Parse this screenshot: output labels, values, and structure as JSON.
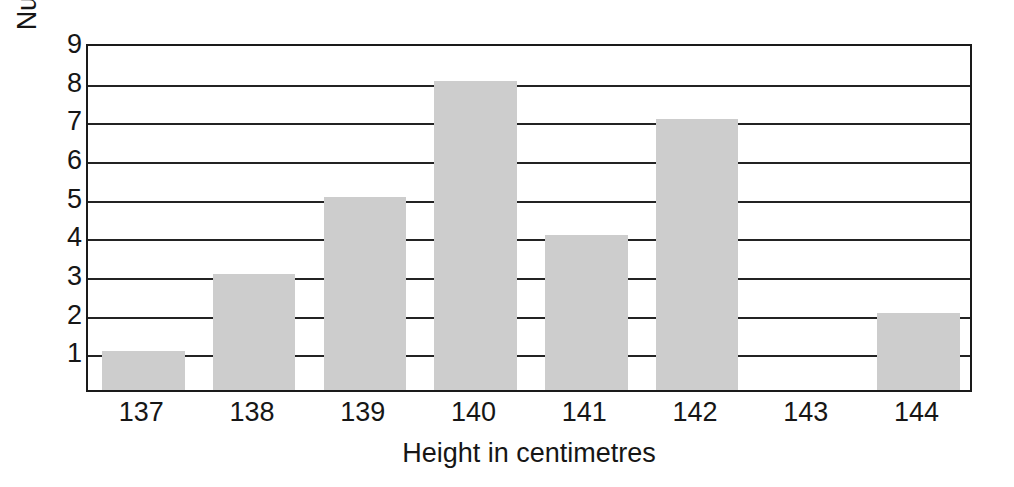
{
  "chart_data": {
    "type": "bar",
    "title": "",
    "subtitle": "",
    "xlabel": "Height in centimetres",
    "ylabel": "Number of children",
    "categories": [
      "137",
      "138",
      "139",
      "140",
      "141",
      "142",
      "143",
      "144"
    ],
    "values": [
      1,
      3,
      5,
      8,
      4,
      7,
      0,
      2
    ],
    "series": [
      {
        "name": "Number of children",
        "values": [
          1,
          3,
          5,
          8,
          4,
          7,
          0,
          2
        ]
      }
    ],
    "ylim": [
      0,
      9
    ],
    "yticks": [
      1,
      2,
      3,
      4,
      5,
      6,
      7,
      8,
      9
    ],
    "ytick_labels": [
      "1",
      "2",
      "3",
      "4",
      "5",
      "6",
      "7",
      "8",
      "9"
    ],
    "xtick_labels": [
      "137",
      "138",
      "139",
      "140",
      "141",
      "142",
      "143",
      "144"
    ],
    "grid": "horizontal",
    "legend": "none",
    "legend_position": "none",
    "bar_color": "#cdcdcd",
    "axis_color": "#1a1a1a",
    "grid_color": "#232323",
    "background_color": "#ffffff",
    "annotations": []
  }
}
